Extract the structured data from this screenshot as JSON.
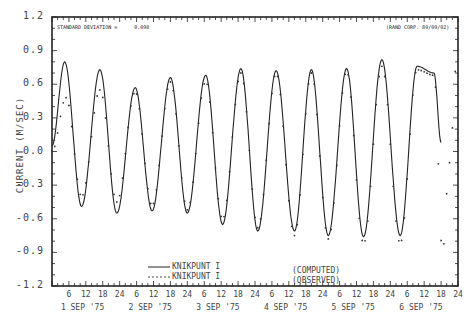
{
  "chart_data": {
    "type": "line",
    "title": "",
    "annotations": {
      "std_dev_label": "STANDARD DEVIATION =",
      "std_dev_value": "0.098",
      "credit": "(RAND CORP. 80/09/02)"
    },
    "xlabel": "",
    "ylabel": "CURRENT (M/SEC)",
    "ylim": [
      -1.2,
      1.2
    ],
    "yticks": [
      "1.2",
      "0.9",
      "0.6",
      "0.3",
      "0.0",
      "-0.3",
      "-0.6",
      "-0.9",
      "-1.2"
    ],
    "xlim_hours": [
      0,
      144
    ],
    "xtick_hours": [
      "6",
      "12",
      "18",
      "24"
    ],
    "day_labels": [
      "1 SEP '75",
      "2 SEP '75",
      "3 SEP '75",
      "4 SEP '75",
      "5 SEP '75",
      "6 SEP '75"
    ],
    "grid": false,
    "legend": {
      "position": "lower-center",
      "entries": [
        {
          "style": "solid",
          "label": "KNIKPUNT I",
          "kind": "(COMPUTED)"
        },
        {
          "style": "dotted",
          "label": "KNIKPUNT I",
          "kind": "(OBSERVED)"
        }
      ]
    },
    "series": [
      {
        "name": "KNIKPUNT I (COMPUTED)",
        "style": "solid",
        "extrema_hours": [
          0,
          4.5,
          10.5,
          17,
          23,
          29.5,
          35.5,
          42,
          48,
          54.5,
          60.5,
          67,
          73,
          79.5,
          86,
          92,
          98,
          104.5,
          110.5,
          117,
          123.5,
          129.5,
          135.5,
          138
        ],
        "extrema_values": [
          0.05,
          0.8,
          -0.49,
          0.73,
          -0.55,
          0.57,
          -0.53,
          0.66,
          -0.55,
          0.68,
          -0.65,
          0.74,
          -0.71,
          0.72,
          -0.71,
          0.73,
          -0.75,
          0.74,
          -0.76,
          0.82,
          -0.75,
          0.76,
          0.7,
          0.08
        ]
      },
      {
        "name": "KNIKPUNT I (OBSERVED)",
        "style": "dotted",
        "extrema_hours": [
          0,
          5,
          10.5,
          17,
          23,
          29.5,
          35.5,
          42,
          48,
          54.5,
          60.5,
          67,
          73,
          79.5,
          86,
          92,
          98,
          104.5,
          110.5,
          117,
          123.5,
          129.5,
          135.5,
          138.5,
          141,
          143.5
        ],
        "extrema_values": [
          0.0,
          0.48,
          -0.4,
          0.55,
          -0.45,
          0.53,
          -0.48,
          0.62,
          -0.52,
          0.62,
          -0.6,
          0.7,
          -0.68,
          0.69,
          -0.75,
          0.7,
          -0.78,
          0.71,
          -0.82,
          0.76,
          -0.82,
          0.73,
          0.68,
          -0.9,
          -0.1,
          0.8
        ]
      }
    ]
  }
}
